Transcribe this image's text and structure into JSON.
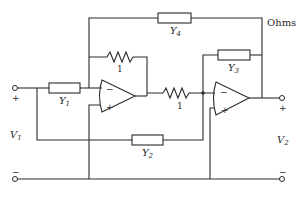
{
  "diagram": {
    "units_label": "Ohms",
    "components": {
      "y1": {
        "label": "Y",
        "sub": "1"
      },
      "y2": {
        "label": "Y",
        "sub": "2"
      },
      "y3": {
        "label": "Y",
        "sub": "3"
      },
      "y4": {
        "label": "Y",
        "sub": "4"
      },
      "r_feedback": {
        "value": "1"
      },
      "r_series": {
        "value": "1"
      }
    },
    "opamps": [
      {
        "inverting": "−",
        "noninverting": "+"
      },
      {
        "inverting": "−",
        "noninverting": "+"
      }
    ],
    "ports": {
      "input": {
        "label": "V",
        "sub": "1",
        "plus": "+",
        "minus": "−"
      },
      "output": {
        "label": "V",
        "sub": "2",
        "plus": "+",
        "minus": "−"
      }
    },
    "colors": {
      "line": "#2b2b2b",
      "background": "#ffffff"
    }
  }
}
